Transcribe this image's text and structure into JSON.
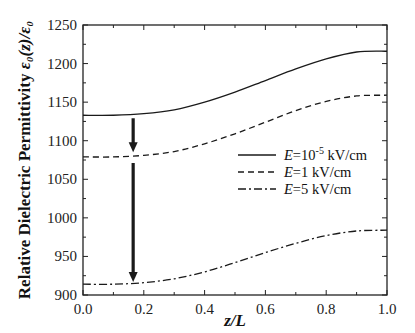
{
  "chart_data": {
    "type": "line",
    "title": "",
    "xlabel": "z/L",
    "ylabel": "Relative Dielectric Permittivity ε0(z)/ε0",
    "xlim": [
      0.0,
      1.0
    ],
    "ylim": [
      900,
      1250
    ],
    "xticks": [
      "0.0",
      "0.2",
      "0.4",
      "0.6",
      "0.8",
      "1.0"
    ],
    "yticks": [
      "900",
      "950",
      "1000",
      "1050",
      "1100",
      "1150",
      "1200",
      "1250"
    ],
    "grid": false,
    "legend_position": "center-right",
    "x": [
      0.0,
      0.1,
      0.2,
      0.3,
      0.4,
      0.5,
      0.6,
      0.7,
      0.8,
      0.9,
      1.0
    ],
    "series": [
      {
        "name": "E=10^-5 kV/cm",
        "style": "solid",
        "values": [
          1133,
          1133,
          1135,
          1140,
          1150,
          1163,
          1178,
          1193,
          1206,
          1215,
          1216
        ]
      },
      {
        "name": "E=1 kV/cm",
        "style": "dashed",
        "values": [
          1079,
          1079,
          1081,
          1086,
          1096,
          1109,
          1124,
          1139,
          1151,
          1158,
          1159
        ]
      },
      {
        "name": "E=5 kV/cm",
        "style": "dash-dot",
        "values": [
          914,
          914,
          916,
          921,
          930,
          942,
          955,
          967,
          977,
          983,
          984
        ]
      }
    ],
    "annotations": [
      {
        "type": "arrow",
        "x": 0.165,
        "from": 1133,
        "to": 1085,
        "note": "downward arrow from solid to dashed curve"
      },
      {
        "type": "arrow",
        "x": 0.165,
        "from": 1075,
        "to": 917,
        "note": "downward arrow from dashed to dash-dot curve"
      }
    ]
  },
  "axes": {
    "x_title_italic": "z/L",
    "y_title_prefix": "Relative Dielectric Permittivity ",
    "y_title_math": "ε₀(z)/ε₀"
  },
  "legend": [
    {
      "prefix": "E",
      "text": "=10",
      "sup": "-5",
      "suffix": " kV/cm",
      "style": "solid"
    },
    {
      "prefix": "E",
      "text": "=1 kV/cm",
      "sup": "",
      "suffix": "",
      "style": "dashed"
    },
    {
      "prefix": "E",
      "text": "=5 kV/cm",
      "sup": "",
      "suffix": "",
      "style": "dash-dot"
    }
  ],
  "colors": {
    "line": "#1a1a1a",
    "axis": "#222222",
    "background": "#ffffff"
  }
}
